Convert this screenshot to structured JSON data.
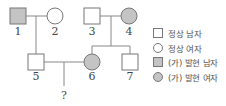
{
  "colors": {
    "affected_fill": "#c4c4c4",
    "normal_fill": "#ffffff",
    "stroke": "#777777",
    "line": "#888888"
  },
  "individuals": [
    {
      "id": "1",
      "label": "1",
      "sex": "male",
      "affected": true
    },
    {
      "id": "2",
      "label": "2",
      "sex": "female",
      "affected": false
    },
    {
      "id": "3",
      "label": "3",
      "sex": "male",
      "affected": false
    },
    {
      "id": "4",
      "label": "4",
      "sex": "female",
      "affected": true
    },
    {
      "id": "5",
      "label": "5",
      "sex": "male",
      "affected": false
    },
    {
      "id": "6",
      "label": "6",
      "sex": "female",
      "affected": true
    },
    {
      "id": "7",
      "label": "7",
      "sex": "male",
      "affected": false
    }
  ],
  "unknown_child": {
    "label": "?"
  },
  "legend": {
    "items": [
      {
        "symbol": "square",
        "affected": false,
        "label": "정상 남자"
      },
      {
        "symbol": "circle",
        "affected": false,
        "label": "정상 여자"
      },
      {
        "symbol": "square",
        "affected": true,
        "label": "(가) 발현 남자"
      },
      {
        "symbol": "circle",
        "affected": true,
        "label": "(가) 발현 여자"
      }
    ]
  }
}
